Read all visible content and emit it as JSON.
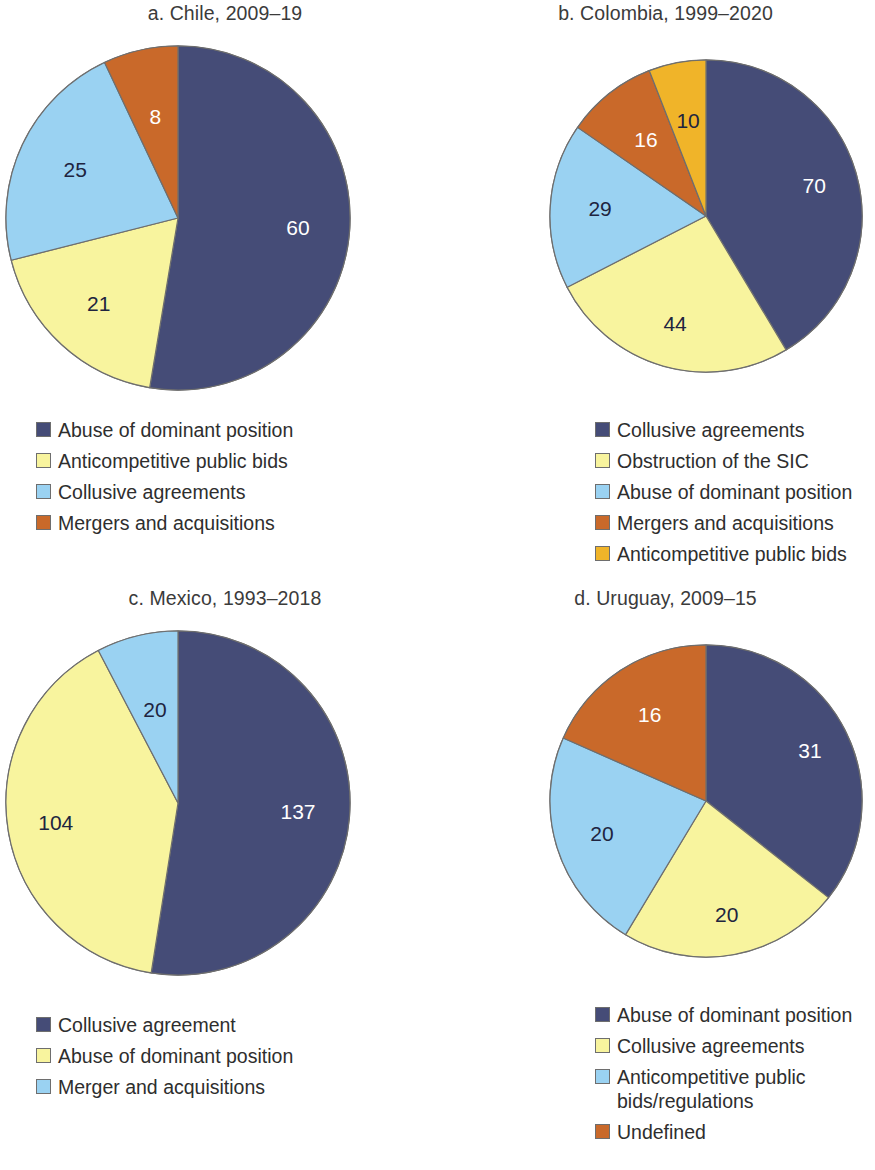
{
  "colors": {
    "navy": "#454C77",
    "pale_yellow": "#F8F49E",
    "light_blue": "#9AD2F2",
    "orange": "#C9692A",
    "gold": "#F0B429",
    "label_dark": "#20243F",
    "label_light": "#FFFFFF",
    "outline": "#6E6E6E",
    "text": "#2E2E2E"
  },
  "chart_data": [
    {
      "type": "pie",
      "id": "chile",
      "title": "a. Chile, 2009–19",
      "categories": [
        "Abuse of dominant position",
        "Anticompetitive public bids",
        "Collusive agreements",
        "Mergers and acquisitions"
      ],
      "values": [
        60,
        21,
        25,
        8
      ],
      "total": 114,
      "slice_colors": [
        "#454C77",
        "#F8F49E",
        "#9AD2F2",
        "#C9692A"
      ],
      "label_styles": [
        "on-dark",
        "on-light",
        "on-light",
        "on-dark"
      ],
      "label_radius_factor": [
        0.7,
        0.68,
        0.66,
        0.6
      ],
      "start_angle_deg": 0,
      "legend_position": "below",
      "legend": [
        {
          "label": "Abuse of dominant position",
          "color": "#454C77"
        },
        {
          "label": "Anticompetitive public bids",
          "color": "#F8F49E"
        },
        {
          "label": "Collusive agreements",
          "color": "#9AD2F2"
        },
        {
          "label": "Mergers and acquisitions",
          "color": "#C9692A"
        }
      ]
    },
    {
      "type": "pie",
      "id": "colombia",
      "title": "b. Colombia, 1999–2020",
      "categories": [
        "Collusive agreements",
        "Obstruction of the SIC",
        "Abuse of dominant position",
        "Mergers and acquisitions",
        "Anticompetitive public bids"
      ],
      "values": [
        70,
        44,
        29,
        16,
        10
      ],
      "total": 169,
      "slice_colors": [
        "#454C77",
        "#F8F49E",
        "#9AD2F2",
        "#C9692A",
        "#F0B429"
      ],
      "label_styles": [
        "on-dark",
        "on-light",
        "on-light",
        "on-dark",
        "on-light"
      ],
      "label_radius_factor": [
        0.72,
        0.72,
        0.68,
        0.62,
        0.62
      ],
      "start_angle_deg": 0,
      "legend_position": "below",
      "legend": [
        {
          "label": "Collusive agreements",
          "color": "#454C77"
        },
        {
          "label": "Obstruction of the SIC",
          "color": "#F8F49E"
        },
        {
          "label": "Abuse of dominant position",
          "color": "#9AD2F2"
        },
        {
          "label": "Mergers and acquisitions",
          "color": "#C9692A"
        },
        {
          "label": "Anticompetitive public bids",
          "color": "#F0B429"
        }
      ]
    },
    {
      "type": "pie",
      "id": "mexico",
      "title": "c. Mexico, 1993–2018",
      "categories": [
        "Collusive agreement",
        "Abuse of dominant position",
        "Merger and acquisitions"
      ],
      "values": [
        137,
        104,
        20
      ],
      "total": 261,
      "slice_colors": [
        "#454C77",
        "#F8F49E",
        "#9AD2F2"
      ],
      "label_styles": [
        "on-dark",
        "on-light",
        "on-light"
      ],
      "label_radius_factor": [
        0.7,
        0.72,
        0.56
      ],
      "start_angle_deg": 0,
      "legend_position": "below",
      "legend": [
        {
          "label": "Collusive agreement",
          "color": "#454C77"
        },
        {
          "label": "Abuse of dominant position",
          "color": "#F8F49E"
        },
        {
          "label": "Merger and acquisitions",
          "color": "#9AD2F2"
        }
      ]
    },
    {
      "type": "pie",
      "id": "uruguay",
      "title": "d. Uruguay, 2009–15",
      "categories": [
        "Abuse of dominant position",
        "Collusive agreements",
        "Anticompetitive public bids/regulations",
        "Undefined"
      ],
      "values": [
        31,
        20,
        20,
        16
      ],
      "total": 87,
      "slice_colors": [
        "#454C77",
        "#F8F49E",
        "#9AD2F2",
        "#C9692A"
      ],
      "label_styles": [
        "on-dark",
        "on-light",
        "on-light",
        "on-dark"
      ],
      "label_radius_factor": [
        0.74,
        0.74,
        0.7,
        0.66
      ],
      "start_angle_deg": 0,
      "legend_position": "below",
      "legend": [
        {
          "label": "Abuse of dominant position",
          "color": "#454C77"
        },
        {
          "label": "Collusive agreements",
          "color": "#F8F49E"
        },
        {
          "label": "Anticompetitive public\nbids/regulations",
          "color": "#9AD2F2"
        },
        {
          "label": "Undefined",
          "color": "#C9692A"
        }
      ]
    }
  ]
}
